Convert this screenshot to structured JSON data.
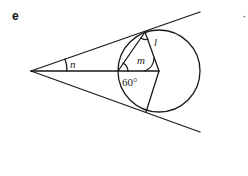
{
  "panel": {
    "label": "e",
    "stray_mark": "·"
  },
  "diagram": {
    "labels": {
      "n": "n",
      "m": "m",
      "l": "l",
      "angle_60": "60°"
    },
    "colors": {
      "stroke": "#1a1a1a",
      "background": "#ffffff"
    }
  }
}
